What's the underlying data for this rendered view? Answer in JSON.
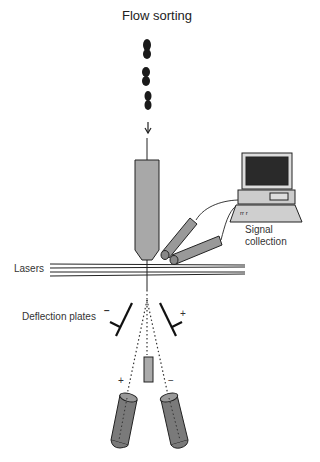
{
  "title": "Flow sorting",
  "labels": {
    "signal_collection_1": "Signal",
    "signal_collection_2": "collection",
    "lasers": "Lasers",
    "deflection_plates": "Deflection plates",
    "plate_left_sign": "−",
    "plate_right_sign": "+",
    "tube_left_sign": "+",
    "tube_right_sign": "−"
  },
  "colors": {
    "line": "#222222",
    "gray_fill": "#9a9a9a",
    "dark_gray_fill": "#7a7a7a",
    "monitor_screen": "#2a2a2a"
  }
}
